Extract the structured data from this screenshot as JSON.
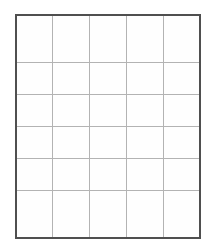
{
  "page": {
    "background_color": "#ffffff"
  },
  "table": {
    "name": "blank-grid",
    "columns": 5,
    "rows": 6,
    "border_color": "#4f4f4f",
    "gridline_color": "#b3b3b3",
    "cell_background": "#fefefe",
    "outer_border_width_px": 2,
    "inner_border_width_px": 1,
    "bounds": {
      "left_px": 15,
      "top_px": 14,
      "width_px": 186,
      "height_px": 225
    },
    "column_headers": [
      "",
      "",
      "",
      "",
      ""
    ],
    "cells": [
      [
        "",
        "",
        "",
        "",
        ""
      ],
      [
        "",
        "",
        "",
        "",
        ""
      ],
      [
        "",
        "",
        "",
        "",
        ""
      ],
      [
        "",
        "",
        "",
        "",
        ""
      ],
      [
        "",
        "",
        "",
        "",
        ""
      ],
      [
        "",
        "",
        "",
        "",
        ""
      ]
    ]
  }
}
